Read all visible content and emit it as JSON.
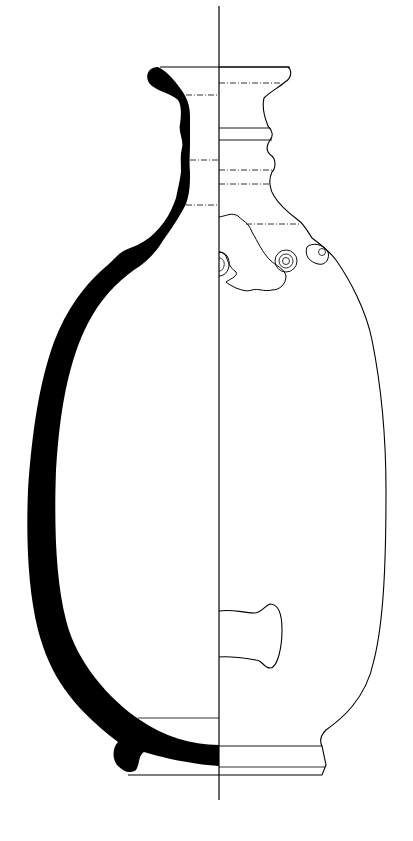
{
  "figure": {
    "title": "Pottery vessel profile drawing",
    "colors": {
      "background": "#ffffff",
      "section_fill": "#000000",
      "line": "#000000"
    },
    "parts": {
      "axis": "central vertical axis",
      "section": "cross-section (left half, solid black)",
      "exterior": "exterior elevation (right half)",
      "neck": "ridged neck with horizontal ribs",
      "rim": "everted rim",
      "bosses": "applied stamped circular bosses",
      "break": "damaged / broken area on shoulder",
      "handle": "horizontal lug handle",
      "foot": "ring foot base"
    }
  }
}
